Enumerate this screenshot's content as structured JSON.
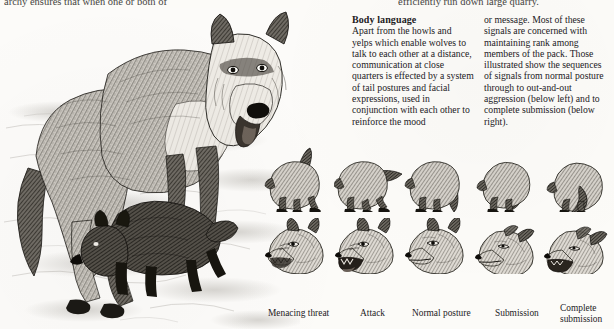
{
  "page": {
    "background_color": "#fcfbf8",
    "ink_color": "#23211e"
  },
  "running_text": {
    "left_fragment": "archy ensures that when one or both of",
    "right_fragment": "efficiently run down large quarry."
  },
  "article": {
    "heading": "Body language",
    "column_left": "Apart from the howls and yelps which enable wolves to talk to each other at a distance, communication at close quarters is effected by a system of tail postures and facial expressions, used in conjunction with each other to reinforce the mood",
    "column_right": "or message. Most of these signals are concerned with maintaining rank among members of the pack. Those illustrated show the sequences of signals from normal posture through to out-and-out aggression (below left) and to complete submission (below right)."
  },
  "main_plate": {
    "description": "Engraving of an adult wolf standing in snow with a wolf pup walking beneath it",
    "subjects": [
      "adult-wolf",
      "wolf-pup",
      "snow-drift-ground"
    ]
  },
  "figures": {
    "row_labels": [
      "tail-posture-rear-view",
      "facial-expression-head"
    ],
    "columns": [
      {
        "caption": "Menacing threat",
        "tail": "tail raised high and bristled",
        "face": "snarling, teeth bared, ears forward"
      },
      {
        "caption": "Attack",
        "tail": "tail straight out horizontally",
        "face": "open mouth, teeth showing, ears forward"
      },
      {
        "caption": "Normal posture",
        "tail": "tail hanging down relaxed",
        "face": "mouth closed, ears erect"
      },
      {
        "caption": "Submission",
        "tail": "tail tucked low between legs",
        "face": "ears flattened back, eyes narrowed"
      },
      {
        "caption": "Complete submission",
        "tail": "tail fully curled under belly, body crouched",
        "face": "ears flat, mouth pulled back in grin"
      }
    ]
  }
}
